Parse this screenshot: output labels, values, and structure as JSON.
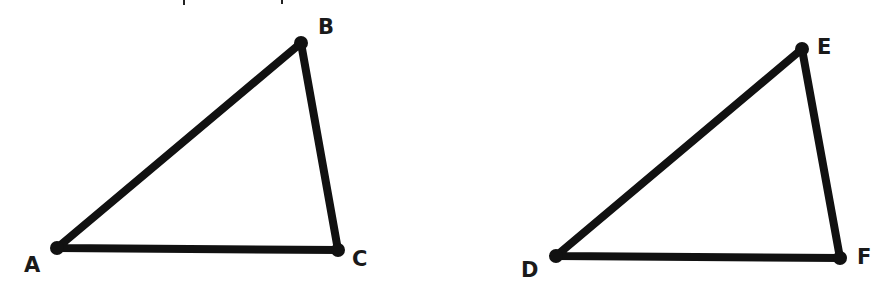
{
  "figure": {
    "background": "#ffffff",
    "stroke_color": "#111111",
    "triangles": [
      {
        "name": "ABC",
        "vertices": [
          {
            "label": "A",
            "x": 57,
            "y": 248,
            "label_x": 24,
            "label_y": 272
          },
          {
            "label": "B",
            "x": 301,
            "y": 43,
            "label_x": 318,
            "label_y": 34
          },
          {
            "label": "C",
            "x": 338,
            "y": 250,
            "label_x": 352,
            "label_y": 266
          }
        ]
      },
      {
        "name": "DEF",
        "vertices": [
          {
            "label": "D",
            "x": 556,
            "y": 256,
            "label_x": 521,
            "label_y": 277
          },
          {
            "label": "E",
            "x": 802,
            "y": 49,
            "label_x": 817,
            "label_y": 54
          },
          {
            "label": "F",
            "x": 840,
            "y": 258,
            "label_x": 857,
            "label_y": 264
          }
        ]
      }
    ]
  }
}
